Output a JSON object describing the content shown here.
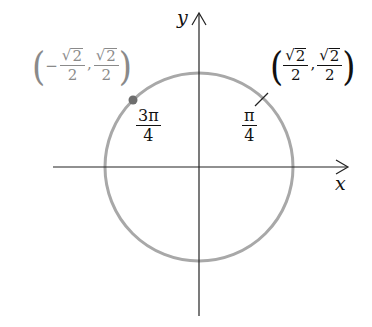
{
  "diagram": {
    "type": "unit-circle",
    "axes": {
      "x_label": "x",
      "y_label": "y"
    },
    "colors": {
      "axis": "#222222",
      "circle": "#a8a8a8",
      "point": "#6e6e6e",
      "label_dark": "#111111",
      "label_gray": "#8a8a8a"
    },
    "geometry": {
      "center": [
        199,
        167
      ],
      "radius": 94
    },
    "angles": [
      {
        "name": "pi-over-4",
        "numerator": "π",
        "denominator": "4"
      },
      {
        "name": "3pi-over-4",
        "numerator": "3π",
        "denominator": "4"
      }
    ],
    "points": [
      {
        "name": "first-quadrant-point",
        "x_sign": "",
        "x_num": "2",
        "x_den": "2",
        "y_num": "2",
        "y_den": "2",
        "sqrt_symbol": "√",
        "comma": ",",
        "open_paren": "(",
        "close_paren": ")"
      },
      {
        "name": "second-quadrant-point",
        "x_sign": "−",
        "x_num": "2",
        "x_den": "2",
        "y_num": "2",
        "y_den": "2",
        "sqrt_symbol": "√",
        "comma": ",",
        "open_paren": "(",
        "close_paren": ")"
      }
    ]
  }
}
